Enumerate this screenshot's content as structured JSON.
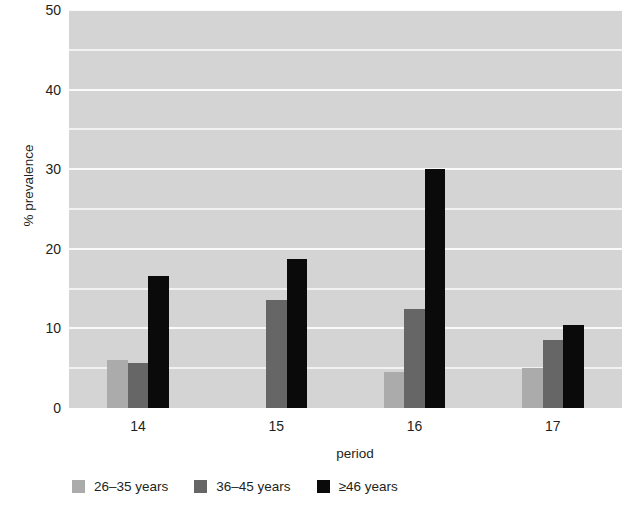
{
  "chart_data": {
    "type": "bar",
    "title": "",
    "subtitle": "",
    "xlabel": "period",
    "ylabel": "% prevalence",
    "categories": [
      "14",
      "15",
      "16",
      "17"
    ],
    "series": [
      {
        "name": "26–35 years",
        "color": "#ababab",
        "values": [
          6.0,
          0,
          4.5,
          5.0
        ]
      },
      {
        "name": "36–45 years",
        "color": "#666666",
        "values": [
          5.7,
          13.6,
          12.4,
          8.5
        ]
      },
      {
        "name": "≥46 years",
        "color": "#0a0a0a",
        "values": [
          16.6,
          18.7,
          30.0,
          10.4
        ]
      }
    ],
    "ylim": [
      0,
      50
    ],
    "y_ticks": [
      0,
      10,
      20,
      30,
      40,
      50
    ],
    "y_tick_labels": [
      "0",
      "10",
      "20",
      "30",
      "40",
      "50"
    ],
    "y_minor_gridlines": [
      5,
      15,
      25,
      35,
      45
    ],
    "grid": true,
    "grid_color": "#f5f5f5",
    "plot_background": "#d4d4d4",
    "legend_position": "bottom",
    "legend": [
      "26–35 years",
      "36–45 years",
      "≥46 years"
    ]
  }
}
